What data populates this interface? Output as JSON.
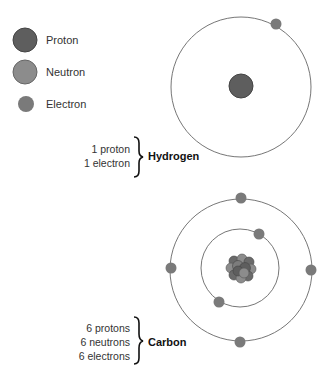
{
  "legend": {
    "items": [
      {
        "label": "Proton",
        "color": "#5e5e5e"
      },
      {
        "label": "Neutron",
        "color": "#8c8c8c"
      },
      {
        "label": "Electron",
        "color": "#7a7a7a"
      }
    ]
  },
  "atoms": [
    {
      "name": "Hydrogen",
      "counts": [
        "1 proton",
        "1 electron"
      ],
      "shells": 1,
      "electrons": 1
    },
    {
      "name": "Carbon",
      "counts": [
        "6 protons",
        "6 neutrons",
        "6 electrons"
      ],
      "shells": 2,
      "electrons": 6
    }
  ],
  "colors": {
    "orbit": "#666666",
    "proton": "#5e5e5e",
    "neutron": "#8c8c8c",
    "electron": "#7a7a7a"
  }
}
